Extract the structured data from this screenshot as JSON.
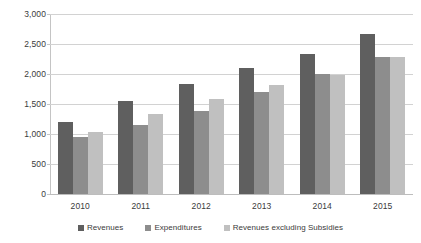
{
  "chart_data": {
    "type": "bar",
    "title": "",
    "subtitle": "",
    "xlabel": "",
    "ylabel": "",
    "categories": [
      "2010",
      "2011",
      "2012",
      "2013",
      "2014",
      "2015"
    ],
    "series": [
      {
        "name": "Revenues",
        "color": "#5f5f5f",
        "values": [
          1200,
          1550,
          1830,
          2100,
          2340,
          2670
        ]
      },
      {
        "name": "Expenditures",
        "color": "#8d8d8d",
        "values": [
          950,
          1150,
          1390,
          1700,
          2000,
          2280
        ]
      },
      {
        "name": "Revenues excluding Subsidies",
        "color": "#c0c0c0",
        "values": [
          1030,
          1340,
          1580,
          1810,
          1990,
          2280
        ]
      }
    ],
    "ylim": [
      0,
      3000
    ],
    "ytick_step": 500,
    "ytick_labels": [
      "0",
      "500",
      "1,000",
      "1,500",
      "2,000",
      "2,500",
      "3,000"
    ],
    "grid": true,
    "grid_axis": "y",
    "legend_position": "bottom-center",
    "background": "#ffffff",
    "grid_color": "#d2d2d2",
    "axis_color": "#c4c4c4",
    "text_color": "#3a3a3a"
  }
}
